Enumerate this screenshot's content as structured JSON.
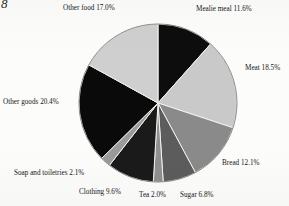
{
  "page": {
    "page_number": "8",
    "background_color": "#fcfcfa"
  },
  "chart_data": {
    "type": "pie",
    "title": "",
    "subtitle": "",
    "xlabel": "",
    "ylabel": "",
    "legend_position": "labels-outside",
    "grid": false,
    "start_angle_deg": 0,
    "direction": "clockwise",
    "center": [
      158,
      103
    ],
    "radius": 79,
    "labels": [
      "Mealie meal",
      "Meat",
      "Bread",
      "Sugar",
      "Tea",
      "Clothing",
      "Soap and toiletries",
      "Other goods",
      "Other food"
    ],
    "values": [
      11.6,
      18.5,
      12.1,
      6.8,
      2.0,
      9.6,
      2.1,
      20.4,
      17.0
    ],
    "value_suffix": "%",
    "colors": [
      "#0d0d0d",
      "#c9c9c9",
      "#8a8a8a",
      "#5c5c5c",
      "#8f8f8f",
      "#1a1a1a",
      "#9a9a9a",
      "#0a0a0a",
      "#cfcfcf"
    ],
    "slice_border_color": "#f2f2ee",
    "annotations": [
      "Mealie meal 11.6%",
      "Meat 18.5%",
      "Bread 12.1%",
      "Sugar 6.8%",
      "Tea 2.0%",
      "Clothing 9.6%",
      "Soap and toiletries 2.1%",
      "Other goods 20.4%",
      "Other food 17.0%"
    ]
  },
  "labels": {
    "mealie_meal": "Mealie meal 11.6%",
    "meat": "Meat 18.5%",
    "bread": "Bread 12.1%",
    "sugar": "Sugar 6.8%",
    "tea": "Tea 2.0%",
    "clothing": "Clothing 9.6%",
    "soap_and_toiletries": "Soap and toiletries 2.1%",
    "other_goods": "Other goods 20.4%",
    "other_food": "Other food 17.0%"
  }
}
